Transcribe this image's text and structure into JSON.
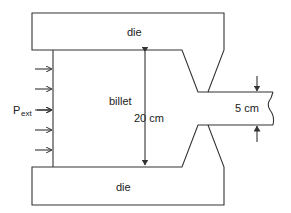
{
  "diagram": {
    "type": "extrusion-die-cross-section",
    "labels": {
      "top_die": "die",
      "bottom_die": "die",
      "billet": "billet",
      "pressure_main": "P",
      "pressure_sub": "ext",
      "billet_diameter": "20 cm",
      "exit_diameter": "5 cm"
    },
    "pressure_arrows_count": 6,
    "colors": {
      "line": "#333333",
      "text": "#222222",
      "background": "#ffffff"
    }
  }
}
